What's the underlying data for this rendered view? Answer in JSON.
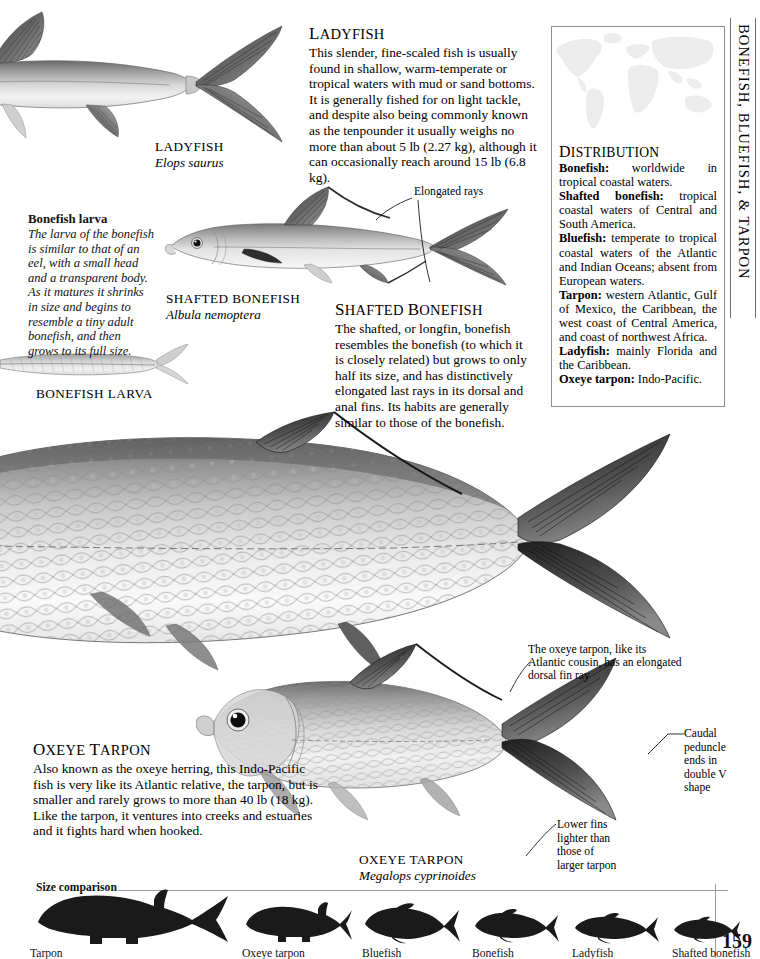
{
  "running_head": "BONEFISH, BLUEFISH, & TARPON",
  "page_number": "159",
  "ladyfish": {
    "heading_first": "L",
    "heading_rest": "ADYFISH",
    "body": "This slender, fine-scaled fish is usually found in shallow, warm-temperate or tropical waters with mud or sand bottoms. It is generally fished for on light tackle, and despite also being commonly known as the tenpounder it usually weighs no more than about 5 lb (2.27 kg), although it can occasionally reach around 15 lb (6.8 kg).",
    "caption_name": "LADYFISH",
    "caption_latin": "Elops saurus"
  },
  "bonefish_larva": {
    "title": "Bonefish larva",
    "body": "The larva of the bonefish is similar to that of an eel, with a small head and a transparent body. As it matures it shrinks in size and begins to resemble a tiny adult bonefish, and then grows to its full size.",
    "caption_name": "BONEFISH LARVA"
  },
  "shafted_bonefish": {
    "heading_first": "S",
    "heading_rest_a": "HAFTED ",
    "heading_second": "B",
    "heading_rest_b": "ONEFISH",
    "body": "The shafted, or longfin, bonefish resembles the bonefish (to which it is closely related) but grows to only half its size, and has distinctively elongated last rays in its dorsal and anal fins. Its habits are generally similar to those of the bonefish.",
    "caption_name": "SHAFTED BONEFISH",
    "caption_latin": "Albula nemoptera",
    "annotation_elongated_rays": "Elongated rays"
  },
  "oxeye_tarpon": {
    "heading_first": "O",
    "heading_rest_a": "XEYE ",
    "heading_second": "T",
    "heading_rest_b": "ARPON",
    "body": "Also known as the oxeye herring, this Indo-Pacific fish is very like its Atlantic relative, the tarpon, but is smaller and rarely grows to more than 40 lb (18 kg). Like the tarpon, it ventures into creeks and estuaries and it fights hard when hooked.",
    "caption_name": "OXEYE TARPON",
    "caption_latin": "Megalops cyprinoides",
    "annotation_dorsal": "The oxeye tarpon, like its Atlantic cousin, has an elongated dorsal fin ray",
    "annotation_caudal": "Caudal peduncle ends in double V shape",
    "annotation_lower_fins": "Lower fins lighter than those of larger tarpon"
  },
  "distribution": {
    "title_first": "D",
    "title_rest": "ISTRIBUTION",
    "entries": [
      {
        "label": "Bonefish:",
        "text": " worldwide in tropical coastal waters."
      },
      {
        "label": "Shafted bonefish:",
        "text": " tropical coastal waters of Central and South America."
      },
      {
        "label": "Bluefish:",
        "text": " temperate to tropical coastal waters of the Atlantic and Indian Oceans; absent from European waters."
      },
      {
        "label": "Tarpon:",
        "text": " western Atlantic, Gulf of Mexico, the Caribbean, the west coast of Central America, and coast of northwest Africa."
      },
      {
        "label": "Ladyfish:",
        "text": " mainly Florida and the Caribbean."
      },
      {
        "label": "Oxeye tarpon:",
        "text": " Indo-Pacific."
      }
    ]
  },
  "size_comparison": {
    "label": "Size comparison",
    "items": [
      {
        "name": "Tarpon"
      },
      {
        "name": "Oxeye tarpon"
      },
      {
        "name": "Bluefish"
      },
      {
        "name": "Bonefish"
      },
      {
        "name": "Ladyfish"
      },
      {
        "name": "Shafted bonefish"
      }
    ]
  },
  "colors": {
    "ink": "#000000",
    "rule": "#9a9a9a",
    "panel_border": "#8d8d8d",
    "map_land": "#e8e8e8",
    "silhouette": "#1a1a1a"
  }
}
